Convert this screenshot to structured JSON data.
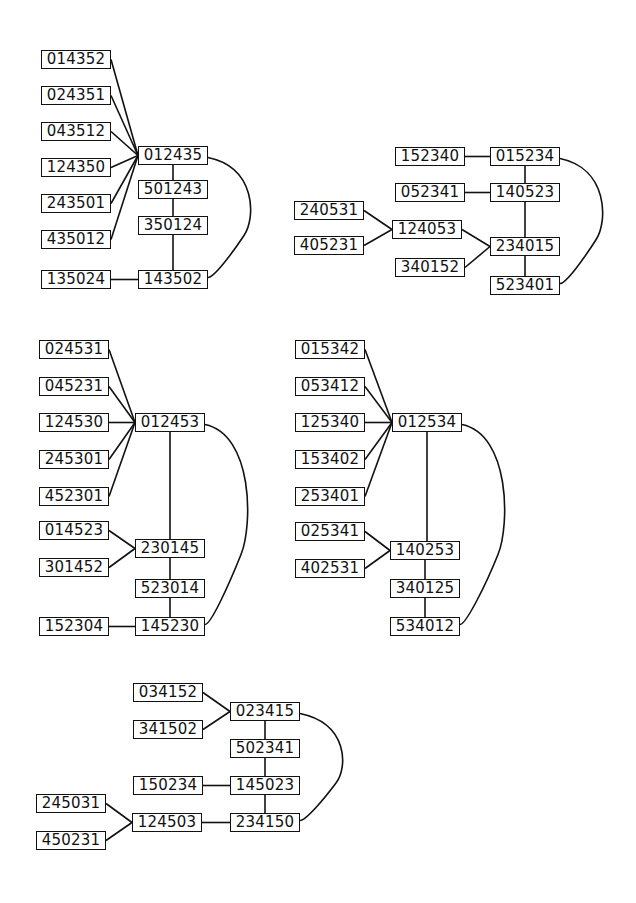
{
  "diagrams": [
    {
      "id": "d1",
      "nodes": [
        {
          "id": "014352",
          "label": "014352",
          "x": 41,
          "y": 50
        },
        {
          "id": "024351",
          "label": "024351",
          "x": 41,
          "y": 86
        },
        {
          "id": "043512",
          "label": "043512",
          "x": 41,
          "y": 122
        },
        {
          "id": "124350",
          "label": "124350",
          "x": 41,
          "y": 158
        },
        {
          "id": "243501",
          "label": "243501",
          "x": 41,
          "y": 194
        },
        {
          "id": "435012",
          "label": "435012",
          "x": 41,
          "y": 230
        },
        {
          "id": "135024",
          "label": "135024",
          "x": 41,
          "y": 270
        },
        {
          "id": "012435",
          "label": "012435",
          "x": 138,
          "y": 146
        },
        {
          "id": "501243",
          "label": "501243",
          "x": 138,
          "y": 180
        },
        {
          "id": "350124",
          "label": "350124",
          "x": 138,
          "y": 216
        },
        {
          "id": "143502",
          "label": "143502",
          "x": 138,
          "y": 270
        }
      ],
      "edges": [
        [
          "014352",
          "012435"
        ],
        [
          "024351",
          "012435"
        ],
        [
          "043512",
          "012435"
        ],
        [
          "124350",
          "012435"
        ],
        [
          "243501",
          "012435"
        ],
        [
          "435012",
          "012435"
        ],
        [
          "012435",
          "501243"
        ],
        [
          "501243",
          "350124"
        ],
        [
          "350124",
          "143502"
        ],
        [
          "135024",
          "143502"
        ]
      ],
      "arcs": [
        [
          "012435",
          "143502"
        ]
      ]
    },
    {
      "id": "d2",
      "nodes": [
        {
          "id": "152340",
          "label": "152340",
          "x": 395,
          "y": 147
        },
        {
          "id": "015234",
          "label": "015234",
          "x": 490,
          "y": 147
        },
        {
          "id": "052341",
          "label": "052341",
          "x": 395,
          "y": 183
        },
        {
          "id": "140523",
          "label": "140523",
          "x": 490,
          "y": 183
        },
        {
          "id": "240531",
          "label": "240531",
          "x": 294,
          "y": 201
        },
        {
          "id": "124053",
          "label": "124053",
          "x": 392,
          "y": 220
        },
        {
          "id": "405231",
          "label": "405231",
          "x": 294,
          "y": 236
        },
        {
          "id": "234015",
          "label": "234015",
          "x": 490,
          "y": 237
        },
        {
          "id": "340152",
          "label": "340152",
          "x": 395,
          "y": 258
        },
        {
          "id": "523401",
          "label": "523401",
          "x": 490,
          "y": 276
        }
      ],
      "edges": [
        [
          "152340",
          "015234"
        ],
        [
          "015234",
          "140523"
        ],
        [
          "052341",
          "140523"
        ],
        [
          "140523",
          "234015"
        ],
        [
          "240531",
          "124053"
        ],
        [
          "405231",
          "124053"
        ],
        [
          "124053",
          "234015"
        ],
        [
          "340152",
          "234015"
        ],
        [
          "234015",
          "523401"
        ]
      ],
      "arcs": [
        [
          "015234",
          "523401"
        ]
      ]
    },
    {
      "id": "d3",
      "nodes": [
        {
          "id": "024531",
          "label": "024531",
          "x": 39,
          "y": 340
        },
        {
          "id": "045231",
          "label": "045231",
          "x": 39,
          "y": 377
        },
        {
          "id": "124530",
          "label": "124530",
          "x": 39,
          "y": 413
        },
        {
          "id": "245301",
          "label": "245301",
          "x": 39,
          "y": 450
        },
        {
          "id": "452301",
          "label": "452301",
          "x": 39,
          "y": 487
        },
        {
          "id": "012453",
          "label": "012453",
          "x": 135,
          "y": 413
        },
        {
          "id": "014523",
          "label": "014523",
          "x": 39,
          "y": 521
        },
        {
          "id": "230145",
          "label": "230145",
          "x": 135,
          "y": 539
        },
        {
          "id": "301452",
          "label": "301452",
          "x": 39,
          "y": 558
        },
        {
          "id": "523014",
          "label": "523014",
          "x": 135,
          "y": 579
        },
        {
          "id": "152304",
          "label": "152304",
          "x": 39,
          "y": 617
        },
        {
          "id": "145230",
          "label": "145230",
          "x": 135,
          "y": 617
        }
      ],
      "edges": [
        [
          "024531",
          "012453"
        ],
        [
          "045231",
          "012453"
        ],
        [
          "124530",
          "012453"
        ],
        [
          "245301",
          "012453"
        ],
        [
          "452301",
          "012453"
        ],
        [
          "012453",
          "230145"
        ],
        [
          "014523",
          "230145"
        ],
        [
          "301452",
          "230145"
        ],
        [
          "230145",
          "523014"
        ],
        [
          "523014",
          "145230"
        ],
        [
          "152304",
          "145230"
        ]
      ],
      "arcs": [
        [
          "012453",
          "145230"
        ]
      ]
    },
    {
      "id": "d4",
      "nodes": [
        {
          "id": "015342",
          "label": "015342",
          "x": 295,
          "y": 340
        },
        {
          "id": "053412",
          "label": "053412",
          "x": 295,
          "y": 377
        },
        {
          "id": "125340",
          "label": "125340",
          "x": 295,
          "y": 413
        },
        {
          "id": "153402",
          "label": "153402",
          "x": 295,
          "y": 450
        },
        {
          "id": "253401",
          "label": "253401",
          "x": 295,
          "y": 487
        },
        {
          "id": "012534",
          "label": "012534",
          "x": 392,
          "y": 413
        },
        {
          "id": "025341",
          "label": "025341",
          "x": 295,
          "y": 522
        },
        {
          "id": "140253",
          "label": "140253",
          "x": 390,
          "y": 541
        },
        {
          "id": "402531",
          "label": "402531",
          "x": 295,
          "y": 559
        },
        {
          "id": "340125",
          "label": "340125",
          "x": 390,
          "y": 579
        },
        {
          "id": "534012",
          "label": "534012",
          "x": 390,
          "y": 617
        }
      ],
      "edges": [
        [
          "015342",
          "012534"
        ],
        [
          "053412",
          "012534"
        ],
        [
          "125340",
          "012534"
        ],
        [
          "153402",
          "012534"
        ],
        [
          "253401",
          "012534"
        ],
        [
          "012534",
          "140253"
        ],
        [
          "025341",
          "140253"
        ],
        [
          "402531",
          "140253"
        ],
        [
          "140253",
          "340125"
        ],
        [
          "340125",
          "534012"
        ]
      ],
      "arcs": [
        [
          "012534",
          "534012"
        ]
      ]
    },
    {
      "id": "d5",
      "nodes": [
        {
          "id": "034152",
          "label": "034152",
          "x": 133,
          "y": 683
        },
        {
          "id": "023415",
          "label": "023415",
          "x": 230,
          "y": 702
        },
        {
          "id": "341502",
          "label": "341502",
          "x": 133,
          "y": 720
        },
        {
          "id": "502341",
          "label": "502341",
          "x": 230,
          "y": 739
        },
        {
          "id": "150234",
          "label": "150234",
          "x": 133,
          "y": 776
        },
        {
          "id": "145023",
          "label": "145023",
          "x": 230,
          "y": 776
        },
        {
          "id": "245031",
          "label": "245031",
          "x": 36,
          "y": 794
        },
        {
          "id": "124503",
          "label": "124503",
          "x": 132,
          "y": 813
        },
        {
          "id": "234150",
          "label": "234150",
          "x": 230,
          "y": 813
        },
        {
          "id": "450231",
          "label": "450231",
          "x": 36,
          "y": 831
        }
      ],
      "edges": [
        [
          "034152",
          "023415"
        ],
        [
          "341502",
          "023415"
        ],
        [
          "023415",
          "502341"
        ],
        [
          "502341",
          "145023"
        ],
        [
          "150234",
          "145023"
        ],
        [
          "145023",
          "234150"
        ],
        [
          "245031",
          "124503"
        ],
        [
          "450231",
          "124503"
        ],
        [
          "124503",
          "234150"
        ]
      ],
      "arcs": [
        [
          "023415",
          "234150"
        ]
      ]
    }
  ],
  "style": {
    "stroke": "#111111",
    "background": "#ffffff"
  }
}
